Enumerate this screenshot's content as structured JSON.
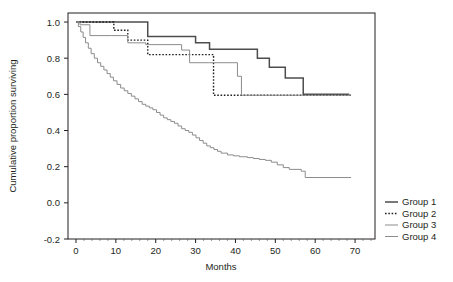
{
  "chart_data": {
    "type": "line",
    "title": "",
    "subtitle": "",
    "xlabel": "Months",
    "ylabel": "Cumulative proportion surviving",
    "xlim": [
      -2,
      75
    ],
    "ylim": [
      -0.2,
      1.05
    ],
    "xticks": [
      0,
      10,
      20,
      30,
      40,
      50,
      60,
      70
    ],
    "xtick_labels": [
      "0",
      "10",
      "20",
      "30",
      "40",
      "50",
      "60",
      "70"
    ],
    "yticks": [
      -0.2,
      0.0,
      0.2,
      0.4,
      0.6,
      0.8,
      1.0
    ],
    "ytick_labels": [
      "-0.2",
      "0.0",
      "0.2",
      "0.4",
      "0.6",
      "0.8",
      "1.0"
    ],
    "grid": false,
    "legend_position": "right",
    "step_type": "post",
    "series": [
      {
        "name": "Group 1",
        "style": "solid",
        "color": "#4d4d4d",
        "width": 1.5,
        "x": [
          0,
          1,
          15.5,
          18,
          27,
          30,
          33.5,
          41,
          45.5,
          48.5,
          52.5,
          57,
          68.5
        ],
        "y": [
          1.0,
          1.0,
          1.0,
          0.92,
          0.92,
          0.885,
          0.85,
          0.85,
          0.8,
          0.75,
          0.69,
          0.6,
          0.6
        ]
      },
      {
        "name": "Group 2",
        "style": "dotted",
        "color": "#231f20",
        "width": 1.4,
        "x": [
          0,
          9,
          9.5,
          12.5,
          13,
          18,
          33.5,
          34.5,
          69
        ],
        "y": [
          1.0,
          1.0,
          0.955,
          0.955,
          0.9,
          0.82,
          0.82,
          0.595,
          0.595
        ]
      },
      {
        "name": "Group 3",
        "style": "solid",
        "color": "#8c8c8c",
        "width": 1.0,
        "x": [
          0,
          1,
          3.5,
          9,
          13,
          17.5,
          26.5,
          28.5,
          33.5,
          40.5,
          41.5,
          69
        ],
        "y": [
          1.0,
          0.985,
          0.925,
          0.925,
          0.885,
          0.875,
          0.845,
          0.775,
          0.775,
          0.7,
          0.595,
          0.595
        ]
      },
      {
        "name": "Group 4",
        "style": "solid",
        "color": "#8c8c8c",
        "width": 1.0,
        "x": [
          0,
          0.6,
          1.2,
          1.8,
          2.4,
          3.1,
          3.8,
          4.6,
          5.4,
          6.2,
          7.0,
          7.8,
          8.6,
          9.4,
          10.3,
          11.2,
          12.1,
          13.0,
          13.9,
          14.8,
          15.7,
          16.6,
          17.5,
          18.4,
          19.3,
          20.2,
          21.1,
          22.0,
          22.9,
          23.8,
          24.7,
          25.6,
          26.5,
          27.4,
          28.3,
          29.2,
          30.1,
          31.0,
          31.9,
          32.8,
          33.7,
          34.6,
          35.5,
          36.4,
          38.0,
          39.5,
          41.0,
          43.0,
          44.5,
          46.0,
          47.5,
          49.0,
          50.5,
          52.0,
          53.5,
          56.5,
          57.5,
          69
        ],
        "y": [
          1.0,
          0.975,
          0.945,
          0.915,
          0.885,
          0.855,
          0.825,
          0.8,
          0.775,
          0.755,
          0.735,
          0.715,
          0.695,
          0.675,
          0.655,
          0.635,
          0.62,
          0.605,
          0.59,
          0.575,
          0.56,
          0.545,
          0.535,
          0.525,
          0.515,
          0.5,
          0.485,
          0.47,
          0.46,
          0.45,
          0.44,
          0.425,
          0.41,
          0.4,
          0.39,
          0.375,
          0.36,
          0.345,
          0.33,
          0.315,
          0.305,
          0.295,
          0.285,
          0.275,
          0.265,
          0.26,
          0.255,
          0.25,
          0.245,
          0.24,
          0.235,
          0.225,
          0.21,
          0.195,
          0.185,
          0.175,
          0.14,
          0.14
        ]
      }
    ]
  },
  "axes": {
    "x_title": "Months",
    "y_title": "Cumulative proportion surviving"
  },
  "legend": {
    "items": [
      {
        "label": "Group 1"
      },
      {
        "label": "Group 2"
      },
      {
        "label": "Group 3"
      },
      {
        "label": "Group 4"
      }
    ]
  }
}
